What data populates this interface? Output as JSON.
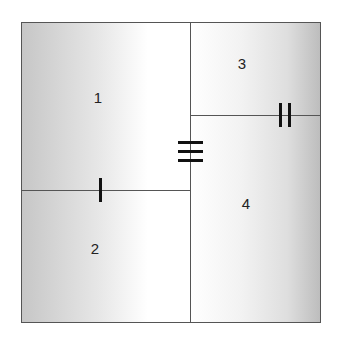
{
  "diagram": {
    "type": "partitioned-square",
    "regions": [
      {
        "id": "1",
        "label": "1"
      },
      {
        "id": "2",
        "label": "2"
      },
      {
        "id": "3",
        "label": "3"
      },
      {
        "id": "4",
        "label": "4"
      }
    ],
    "tick_marks": [
      {
        "segment": "left-horizontal-divider",
        "count": 1,
        "orientation": "vertical"
      },
      {
        "segment": "right-horizontal-divider",
        "count": 2,
        "orientation": "vertical"
      },
      {
        "segment": "central-vertical-divider",
        "count": 3,
        "orientation": "horizontal"
      }
    ],
    "colors": {
      "border": "#555555",
      "tick": "#111111",
      "shade_dark": "#c6c6c6",
      "shade_light": "#ffffff"
    }
  }
}
